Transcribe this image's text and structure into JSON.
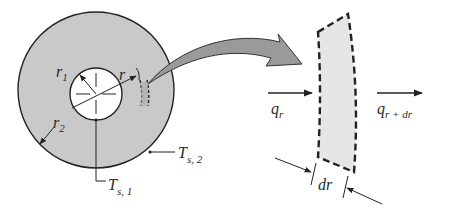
{
  "figure": {
    "colors": {
      "disk_fill": "#c9c9c9",
      "element_fill": "#e6e6e6",
      "arrow_fill": "#9a9a9a",
      "line": "#222222",
      "background": "#ffffff"
    }
  },
  "cylinder": {
    "labels": {
      "inner_radius": {
        "main": "r",
        "sub": "1"
      },
      "outer_radius": {
        "main": "r",
        "sub": "2"
      },
      "radius": {
        "main": "r"
      },
      "inner_surface_temp": {
        "main": "T",
        "sub": "s, 1"
      },
      "outer_surface_temp": {
        "main": "T",
        "sub": "s, 2"
      }
    }
  },
  "element": {
    "labels": {
      "heat_in": {
        "main": "q",
        "sub": "r"
      },
      "heat_out": {
        "main": "q",
        "sub": "r + dr"
      },
      "thickness": "dr"
    }
  }
}
